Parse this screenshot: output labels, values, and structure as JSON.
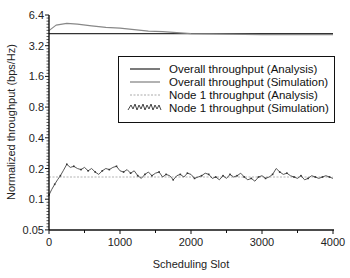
{
  "chart_data": {
    "type": "line",
    "title": "",
    "xlabel": "Scheduling Slot",
    "ylabel": "Normalized throughput (bps/Hz)",
    "xlim": [
      0,
      4000
    ],
    "ylim": [
      0.05,
      6.4
    ],
    "yscale": "log2",
    "grid": false,
    "legend_position": "upper right (inside)",
    "x_ticks": [
      "0",
      "1000",
      "2000",
      "3000",
      "4000"
    ],
    "y_ticks": [
      "0.05",
      "0.1",
      "0.2",
      "0.4",
      "0.8",
      "1.6",
      "3.2",
      "6.4"
    ],
    "series": [
      {
        "name": "Overall throughput (Analysis)",
        "style": "solid dark",
        "color": "#333333",
        "x": [
          0,
          4000
        ],
        "values": [
          4.2,
          4.2
        ]
      },
      {
        "name": "Overall throughput (Simulation)",
        "style": "solid gray",
        "color": "#888888",
        "x": [
          0,
          100,
          250,
          400,
          600,
          800,
          1000,
          1200,
          1400,
          1600,
          1800,
          2000,
          2500,
          3000,
          3500,
          4000
        ],
        "values": [
          4.5,
          5.1,
          5.3,
          5.2,
          5.0,
          4.85,
          4.75,
          4.6,
          4.45,
          4.4,
          4.3,
          4.2,
          4.15,
          4.1,
          4.1,
          4.1
        ]
      },
      {
        "name": "Node 1 throughput (Analysis)",
        "style": "dashed light",
        "color": "#999999",
        "x": [
          0,
          4000
        ],
        "values": [
          0.165,
          0.165
        ]
      },
      {
        "name": "Node 1 throughput (Simulation)",
        "style": "jagged with markers",
        "color": "#444444",
        "x": [
          0,
          40,
          80,
          120,
          160,
          200,
          250,
          300,
          350,
          400,
          450,
          500,
          550,
          600,
          650,
          700,
          750,
          800,
          850,
          900,
          950,
          1000,
          1050,
          1100,
          1150,
          1200,
          1250,
          1300,
          1350,
          1400,
          1450,
          1500,
          1550,
          1600,
          1650,
          1700,
          1750,
          1800,
          1850,
          1900,
          1950,
          2000,
          2050,
          2100,
          2150,
          2200,
          2250,
          2300,
          2350,
          2400,
          2450,
          2500,
          2550,
          2600,
          2650,
          2700,
          2750,
          2800,
          2850,
          2900,
          2950,
          3000,
          3050,
          3100,
          3150,
          3200,
          3250,
          3300,
          3350,
          3400,
          3450,
          3500,
          3550,
          3600,
          3650,
          3700,
          3750,
          3800,
          3850,
          3900,
          3950,
          4000
        ],
        "values": [
          0.11,
          0.125,
          0.14,
          0.155,
          0.17,
          0.19,
          0.22,
          0.205,
          0.21,
          0.2,
          0.195,
          0.205,
          0.19,
          0.2,
          0.185,
          0.175,
          0.19,
          0.2,
          0.195,
          0.205,
          0.21,
          0.19,
          0.185,
          0.195,
          0.18,
          0.19,
          0.17,
          0.16,
          0.175,
          0.185,
          0.17,
          0.18,
          0.185,
          0.165,
          0.175,
          0.17,
          0.155,
          0.17,
          0.175,
          0.165,
          0.18,
          0.175,
          0.16,
          0.165,
          0.17,
          0.18,
          0.175,
          0.16,
          0.165,
          0.155,
          0.17,
          0.16,
          0.175,
          0.165,
          0.17,
          0.18,
          0.165,
          0.155,
          0.16,
          0.15,
          0.165,
          0.17,
          0.16,
          0.165,
          0.175,
          0.2,
          0.185,
          0.175,
          0.18,
          0.17,
          0.165,
          0.16,
          0.17,
          0.155,
          0.16,
          0.17,
          0.165,
          0.16,
          0.165,
          0.17,
          0.165,
          0.16
        ]
      }
    ]
  },
  "axes": {
    "x_title": "Scheduling Slot",
    "y_title": "Normalized throughput (bps/Hz)",
    "x_tick_labels": [
      "0",
      "1000",
      "2000",
      "3000",
      "4000"
    ],
    "y_tick_labels": [
      "6.4",
      "3.2",
      "1.6",
      "0.8",
      "0.4",
      "0.2",
      "0.1",
      "0.05"
    ]
  },
  "legend": {
    "items": [
      {
        "label": "Overall throughput (Analysis)"
      },
      {
        "label": "Overall throughput (Simulation)"
      },
      {
        "label": "Node 1 throughput (Analysis)"
      },
      {
        "label": "Node 1 throughput (Simulation)"
      }
    ]
  }
}
